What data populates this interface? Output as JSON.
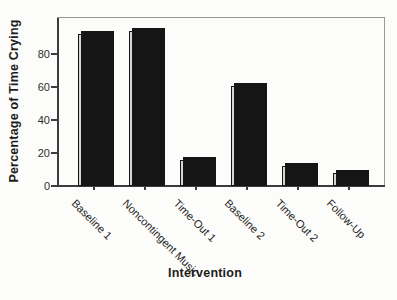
{
  "figure": {
    "paper_color": "#fcfcfa"
  },
  "chart_data": {
    "type": "bar",
    "title": "",
    "xlabel": "Intervention",
    "ylabel": "Percentage of Time Crying",
    "categories": [
      "Baseline 1",
      "Noncontingent Music",
      "Time-Out 1",
      "Baseline 2",
      "Time-Out 2",
      "Follow-Up"
    ],
    "values": [
      92,
      94,
      16,
      61,
      12,
      8
    ],
    "ylim": [
      0,
      102
    ],
    "yticks": [
      0,
      20,
      40,
      60,
      80
    ],
    "grid": false,
    "legend": "none",
    "xtick_label_rotation_deg": 45,
    "bar_fill_color": "#d6d6d2",
    "bar_edge_color": "#151515",
    "axis_color": "#3c3c3c"
  }
}
